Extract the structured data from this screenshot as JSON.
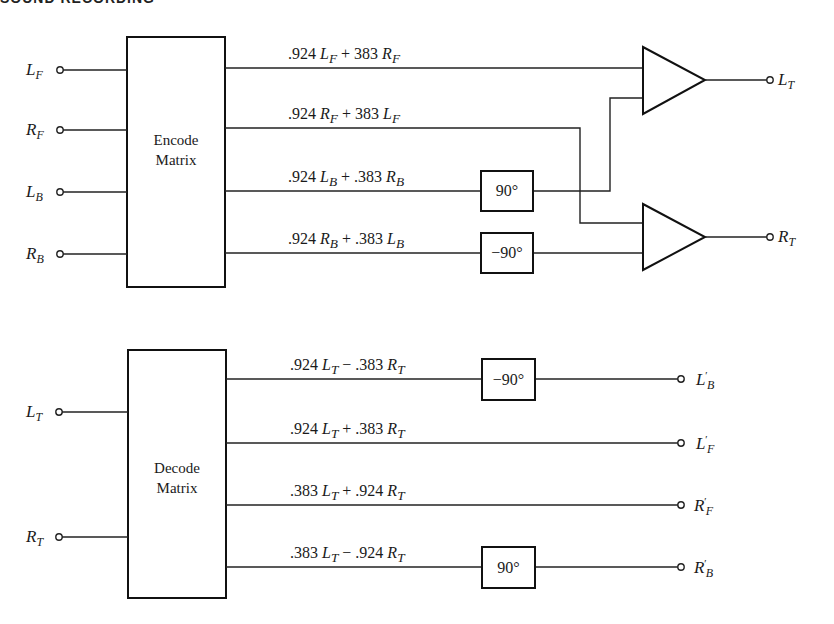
{
  "header": {
    "title": "SOUND RECORDING"
  },
  "encoder": {
    "block_label_line1": "Encode",
    "block_label_line2": "Matrix",
    "inputs": [
      {
        "base": "L",
        "sub": "F"
      },
      {
        "base": "R",
        "sub": "F"
      },
      {
        "base": "L",
        "sub": "B"
      },
      {
        "base": "R",
        "sub": "B"
      }
    ],
    "outputs": [
      {
        "c1": ".924",
        "a": "L",
        "as": "F",
        "op": "+",
        "c2": "383",
        "b": "R",
        "bs": "F"
      },
      {
        "c1": ".924",
        "a": "R",
        "as": "F",
        "op": "+",
        "c2": "383",
        "b": "L",
        "bs": "F"
      },
      {
        "c1": ".924",
        "a": "L",
        "as": "B",
        "op": "+",
        "c2": ".383",
        "b": "R",
        "bs": "B"
      },
      {
        "c1": ".924",
        "a": "R",
        "as": "B",
        "op": "+",
        "c2": ".383",
        "b": "L",
        "bs": "B"
      }
    ],
    "phase_shifters": [
      "90°",
      "−90°"
    ],
    "summed_outputs": [
      {
        "base": "L",
        "sub": "T"
      },
      {
        "base": "R",
        "sub": "T"
      }
    ]
  },
  "decoder": {
    "block_label_line1": "Decode",
    "block_label_line2": "Matrix",
    "inputs": [
      {
        "base": "L",
        "sub": "T"
      },
      {
        "base": "R",
        "sub": "T"
      }
    ],
    "outputs": [
      {
        "c1": ".924",
        "a": "L",
        "as": "T",
        "op": "−",
        "c2": ".383",
        "b": "R",
        "bs": "T"
      },
      {
        "c1": ".924",
        "a": "L",
        "as": "T",
        "op": "+",
        "c2": ".383",
        "b": "R",
        "bs": "T"
      },
      {
        "c1": ".383",
        "a": "L",
        "as": "T",
        "op": "+",
        "c2": ".924",
        "b": "R",
        "bs": "T"
      },
      {
        "c1": ".383",
        "a": "L",
        "as": "T",
        "op": "−",
        "c2": ".924",
        "b": "R",
        "bs": "T"
      }
    ],
    "phase_shifters": [
      "−90°",
      "90°"
    ],
    "recovered_outputs": [
      {
        "base": "L",
        "prime": "′",
        "sub": "B"
      },
      {
        "base": "L",
        "prime": "′",
        "sub": "F"
      },
      {
        "base": "R",
        "prime": "′",
        "sub": "F"
      },
      {
        "base": "R",
        "prime": "′",
        "sub": "B"
      }
    ]
  }
}
